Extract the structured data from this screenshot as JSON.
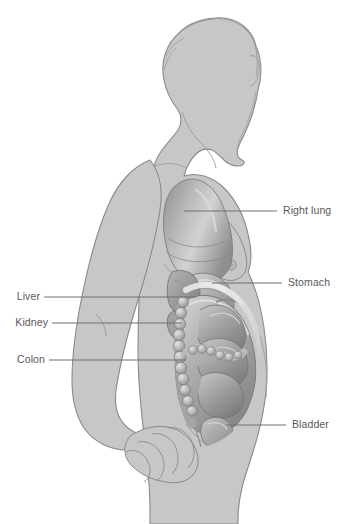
{
  "figure": {
    "orientation": "right-facing lateral view",
    "style": "grayscale medical illustration",
    "background_color": "#ffffff"
  },
  "colors": {
    "background": "#ffffff",
    "body_fill": "#c7c7c7",
    "body_outline": "#8a8a8a",
    "organ_mid": "#a9a9a9",
    "organ_dark": "#7e7e7e",
    "organ_light": "#d8d8d8",
    "leader_line": "#6e6e70",
    "label_text": "#58585a"
  },
  "labels": [
    {
      "id": "right-lung",
      "text": "Right lung",
      "side": "right",
      "text_x": 283,
      "text_y": 205,
      "line_x1": 184,
      "line_y1": 211,
      "line_x2": 277,
      "line_y2": 211
    },
    {
      "id": "stomach",
      "text": "Stomach",
      "side": "right",
      "text_x": 288,
      "text_y": 277,
      "line_x1": 212,
      "line_y1": 283,
      "line_x2": 282,
      "line_y2": 283
    },
    {
      "id": "bladder",
      "text": "Bladder",
      "side": "right",
      "text_x": 292,
      "text_y": 419,
      "line_x1": 226,
      "line_y1": 425,
      "line_x2": 286,
      "line_y2": 425
    },
    {
      "id": "liver",
      "text": "Liver",
      "side": "left",
      "text_x": 36,
      "text_y": 291,
      "line_x1": 44,
      "line_y1": 297,
      "line_x2": 196,
      "line_y2": 297
    },
    {
      "id": "kidney",
      "text": "Kidney",
      "side": "left",
      "text_x": 44,
      "text_y": 317,
      "line_x1": 52,
      "line_y1": 323,
      "line_x2": 182,
      "line_y2": 323
    },
    {
      "id": "colon",
      "text": "Colon",
      "side": "left",
      "text_x": 41,
      "text_y": 354,
      "line_x1": 49,
      "line_y1": 360,
      "line_x2": 186,
      "line_y2": 360
    }
  ],
  "organs": [
    {
      "id": "right-lung",
      "name": "Right lung"
    },
    {
      "id": "stomach",
      "name": "Stomach"
    },
    {
      "id": "liver",
      "name": "Liver"
    },
    {
      "id": "kidney",
      "name": "Kidney"
    },
    {
      "id": "colon",
      "name": "Colon"
    },
    {
      "id": "bladder",
      "name": "Bladder"
    },
    {
      "id": "uterus",
      "name": "Uterus"
    },
    {
      "id": "small-intestine",
      "name": "Small intestine"
    }
  ],
  "body_parts": [
    {
      "id": "head",
      "name": "Head in profile with hair bun"
    },
    {
      "id": "torso",
      "name": "Torso"
    },
    {
      "id": "arm",
      "name": "Arm hanging at side"
    },
    {
      "id": "hand",
      "name": "Hand resting on lower abdomen"
    },
    {
      "id": "breast",
      "name": "Breast"
    },
    {
      "id": "leg",
      "name": "Upper leg"
    }
  ]
}
